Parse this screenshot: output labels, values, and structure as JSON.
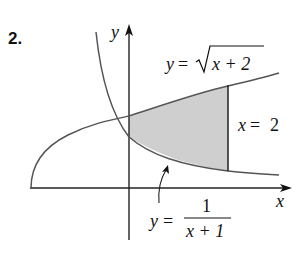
{
  "problem_number": "2.",
  "axes": {
    "x_label": "x",
    "y_label": "y"
  },
  "curves": {
    "upper": {
      "lhs": "y",
      "eq": "=",
      "radicand": "x + 2",
      "full": "y = √(x + 2)"
    },
    "lower": {
      "lhs": "y",
      "eq": "=",
      "numerator": "1",
      "denominator": "x + 1",
      "full": "y = 1/(x + 1)"
    },
    "vertical_line": {
      "var": "x",
      "eq": "=",
      "value": "2",
      "full": "x = 2"
    }
  },
  "colors": {
    "shade": "#cfcfcf",
    "curve": "#555555",
    "axis": "#222222"
  }
}
